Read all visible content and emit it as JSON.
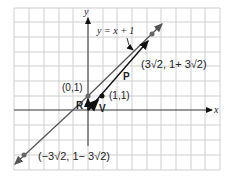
{
  "diagram": {
    "axes": {
      "x_label": "x",
      "y_label": "y"
    },
    "line_label": "y = x + 1",
    "points": {
      "intercept": "(0,1)",
      "unit_point": "(1,1)",
      "upper": "(3√2, 1+ 3√2)",
      "lower": "(−3√2, 1− 3√2)"
    },
    "vectors": {
      "R": "R",
      "V": "V",
      "P": "P"
    },
    "colors": {
      "grid": "#c8c8c8",
      "line": "#555555",
      "axis": "#333333",
      "vector": "#111111",
      "point": "#666666"
    }
  }
}
